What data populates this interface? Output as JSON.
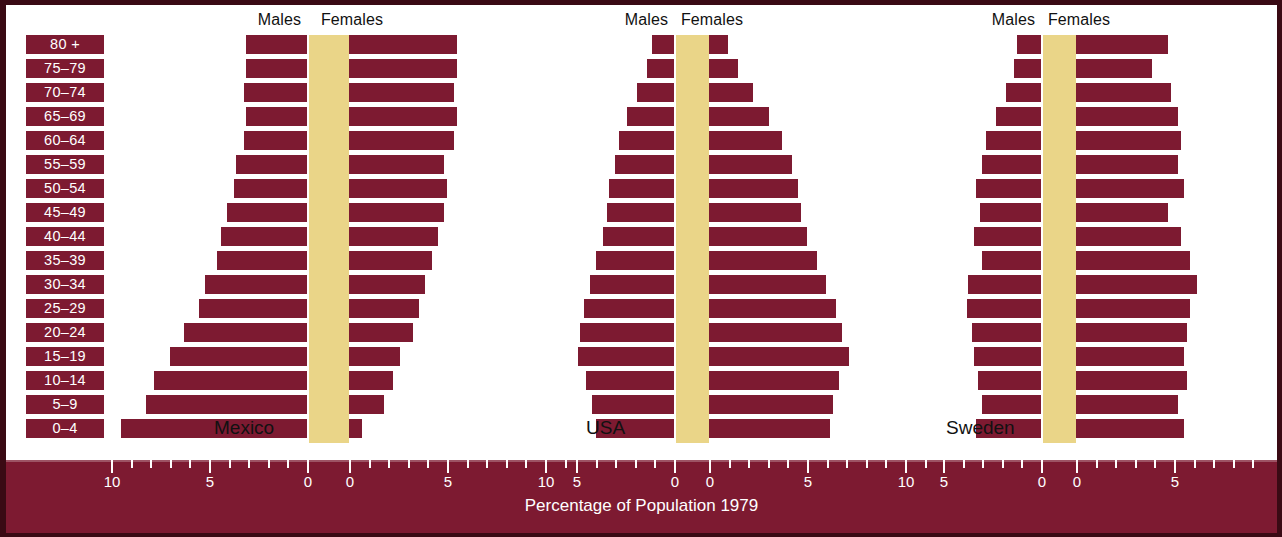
{
  "colors": {
    "bar": "#7d1a31",
    "band": "#ead588",
    "background": "#ffffff",
    "frame": "#3a0a14",
    "axis_text": "#ffffff"
  },
  "axis_title": "Percentage of Population 1979",
  "gender_labels": {
    "males": "Males",
    "females": "Females"
  },
  "age_groups": [
    "80 +",
    "75–79",
    "70–74",
    "65–69",
    "60–64",
    "55–59",
    "50–54",
    "45–49",
    "40–44",
    "35–39",
    "30–34",
    "25–29",
    "20–24",
    "15–19",
    "10–14",
    "5–9",
    "0–4"
  ],
  "panels": [
    {
      "name": "Mexico",
      "males_label": "Males",
      "females_label": "Females",
      "male_ticks": [
        10,
        5,
        0
      ],
      "female_ticks": [
        0,
        5,
        10
      ]
    },
    {
      "name": "USA",
      "males_label": "Males",
      "females_label": "Females",
      "male_ticks": [
        5,
        0
      ],
      "female_ticks": [
        0,
        5,
        10
      ]
    },
    {
      "name": "Sweden",
      "males_label": "Males",
      "females_label": "Females",
      "male_ticks": [
        5,
        0
      ],
      "female_ticks": [
        0,
        5,
        10
      ]
    }
  ],
  "chart_data": {
    "type": "bar",
    "xlabel": "Percentage of Population 1979",
    "ylabel": "Age group",
    "xlim": [
      0,
      11
    ],
    "grid": false,
    "legend": [
      "Males",
      "Females"
    ],
    "categories": [
      "80 +",
      "75–79",
      "70–74",
      "65–69",
      "60–64",
      "55–59",
      "50–54",
      "45–49",
      "40–44",
      "35–39",
      "30–34",
      "25–29",
      "20–24",
      "15–19",
      "10–14",
      "5–9",
      "0–4"
    ],
    "panels": [
      {
        "name": "Mexico",
        "series": [
          {
            "name": "Males",
            "values": [
              3.1,
              3.1,
              3.2,
              3.1,
              3.2,
              3.6,
              3.7,
              4.1,
              4.4,
              4.6,
              5.2,
              5.5,
              6.3,
              7.0,
              7.8,
              8.2,
              9.5
            ]
          },
          {
            "name": "Females",
            "values": [
              3.4,
              3.4,
              3.3,
              3.4,
              3.3,
              3.0,
              3.1,
              3.0,
              2.8,
              2.6,
              2.4,
              2.2,
              2.0,
              1.6,
              1.4,
              1.1,
              0.4
            ]
          }
        ]
      },
      {
        "name": "USA",
        "series": [
          {
            "name": "Males",
            "values": [
              1.1,
              1.4,
              1.9,
              2.4,
              2.8,
              3.0,
              3.3,
              3.4,
              3.6,
              4.0,
              4.3,
              4.6,
              4.8,
              4.9,
              4.5,
              4.2,
              4.0
            ]
          },
          {
            "name": "Females",
            "values": [
              0.6,
              0.9,
              1.4,
              1.9,
              2.3,
              2.6,
              2.8,
              2.9,
              3.1,
              3.4,
              3.7,
              4.0,
              4.2,
              4.4,
              4.1,
              3.9,
              3.8
            ]
          }
        ]
      },
      {
        "name": "Sweden",
        "series": [
          {
            "name": "Males",
            "values": [
              1.2,
              1.4,
              1.8,
              2.3,
              2.8,
              3.0,
              3.3,
              3.1,
              3.4,
              3.0,
              3.7,
              3.8,
              3.5,
              3.4,
              3.2,
              3.0,
              3.3
            ]
          },
          {
            "name": "Females",
            "values": [
              2.9,
              2.4,
              3.0,
              3.2,
              3.3,
              3.2,
              3.4,
              2.9,
              3.3,
              3.6,
              3.8,
              3.6,
              3.5,
              3.4,
              3.5,
              3.2,
              3.4
            ]
          }
        ]
      }
    ]
  },
  "axis": {
    "ticks": [
      {
        "panel": "Mexico",
        "side": "males",
        "labels": [
          "10",
          "5",
          "0"
        ]
      },
      {
        "panel": "Mexico",
        "side": "females",
        "labels": [
          "0",
          "5",
          "10"
        ]
      },
      {
        "panel": "USA",
        "side": "males",
        "labels": [
          "5",
          "0"
        ]
      },
      {
        "panel": "USA",
        "side": "females",
        "labels": [
          "0",
          "5",
          "10"
        ]
      },
      {
        "panel": "Sweden",
        "side": "males",
        "labels": [
          "5",
          "0"
        ]
      },
      {
        "panel": "Sweden",
        "side": "females",
        "labels": [
          "0",
          "5",
          "10"
        ]
      }
    ]
  }
}
